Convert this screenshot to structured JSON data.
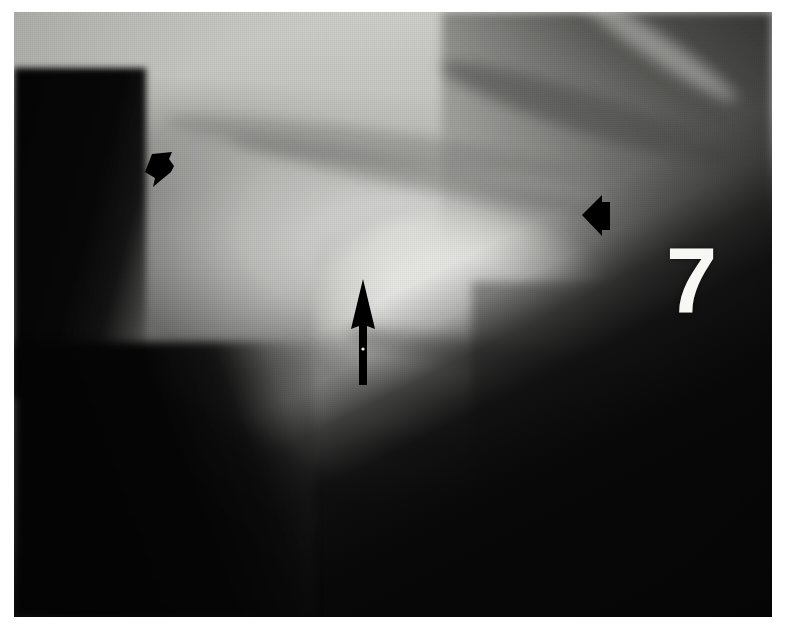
{
  "figure": {
    "label": "7",
    "modality": "radiograph",
    "border_color": "#ffffff",
    "film_dark": "#060606",
    "film_light": "#f7f7f4",
    "marker_color": "#000000",
    "label_color": "#f7f7f4"
  },
  "annotations": [
    {
      "name": "arrowhead-left",
      "glyph": "arrowhead",
      "direction": "right",
      "color": "#000000",
      "x": 124,
      "y": 130,
      "width": 40,
      "height": 50
    },
    {
      "name": "arrowhead-right",
      "glyph": "arrowhead",
      "direction": "left",
      "color": "#000000",
      "x": 564,
      "y": 178,
      "width": 38,
      "height": 50
    },
    {
      "name": "arrow-up",
      "glyph": "arrow",
      "direction": "up",
      "color": "#000000",
      "x": 334,
      "y": 265,
      "width": 30,
      "height": 110
    }
  ],
  "plate": {
    "x": 14,
    "y": 12,
    "width": 758,
    "height": 605
  }
}
